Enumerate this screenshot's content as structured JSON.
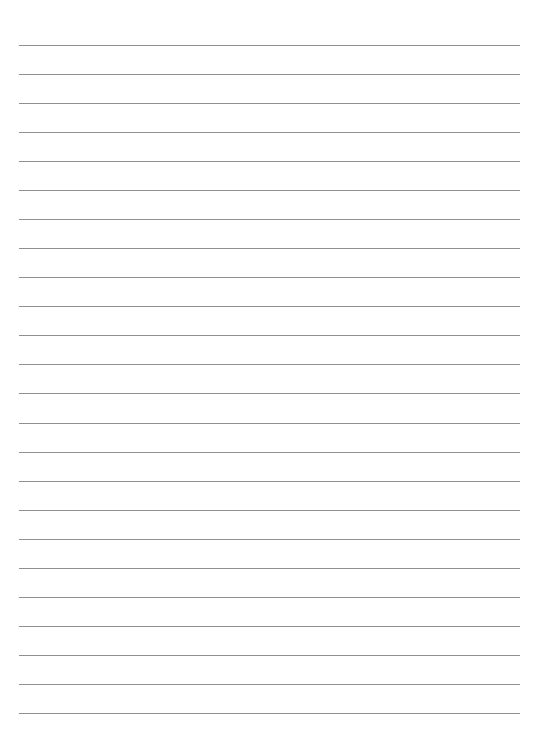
{
  "page": {
    "type": "lined-paper",
    "line_count": 24,
    "first_line_y": 45,
    "line_spacing": 29.04,
    "line_left": 19,
    "line_width": 501,
    "line_color": "#8f8f8f",
    "background_color": "#ffffff"
  }
}
